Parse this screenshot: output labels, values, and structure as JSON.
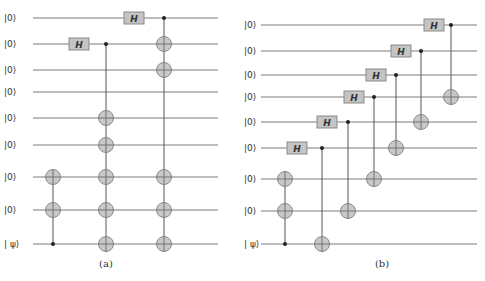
{
  "colors": {
    "wire": "#7a7a7a",
    "gate_fill": "#c4c4c4",
    "target_fill": "#c8c8c8",
    "control": "#222222"
  },
  "gate_label": "H",
  "circuits": [
    {
      "id": "a",
      "caption": "(a)",
      "caption_pos": [
        106,
        267
      ],
      "wire_x": [
        33,
        218
      ],
      "label_x": 4,
      "wires": [
        {
          "label": "|0⟩",
          "y": 18
        },
        {
          "label": "|0⟩",
          "y": 44
        },
        {
          "label": "|0⟩",
          "y": 70
        },
        {
          "label": "|0⟩",
          "y": 92
        },
        {
          "label": "|0⟩",
          "y": 118
        },
        {
          "label": "|0⟩",
          "y": 145
        },
        {
          "label": "|0⟩",
          "y": 177
        },
        {
          "label": "|0⟩",
          "y": 210
        },
        {
          "label": "| ψ⟩",
          "y": 244
        }
      ],
      "hadamards": [
        {
          "wire": 1,
          "x": 79
        },
        {
          "wire": 0,
          "x": 134
        }
      ],
      "gates": [
        {
          "x": 53,
          "control": 8,
          "targets": [
            6,
            7
          ]
        },
        {
          "x": 106,
          "control": 1,
          "targets": [
            4,
            5,
            6,
            7,
            8
          ]
        },
        {
          "x": 164,
          "control": 0,
          "targets": [
            1,
            2,
            6,
            7,
            8
          ]
        }
      ]
    },
    {
      "id": "b",
      "caption": "(b)",
      "caption_pos": [
        382,
        267
      ],
      "wire_x": [
        261,
        477
      ],
      "label_x": 244,
      "wires": [
        {
          "label": "|0⟩",
          "y": 25
        },
        {
          "label": "|0⟩",
          "y": 51
        },
        {
          "label": "|0⟩",
          "y": 75
        },
        {
          "label": "|0⟩",
          "y": 97
        },
        {
          "label": "|0⟩",
          "y": 122
        },
        {
          "label": "|0⟩",
          "y": 148
        },
        {
          "label": "|0⟩",
          "y": 179
        },
        {
          "label": "|0⟩",
          "y": 211
        },
        {
          "label": "| ψ⟩",
          "y": 244
        }
      ],
      "hadamards": [
        {
          "wire": 5,
          "x": 297
        },
        {
          "wire": 4,
          "x": 327
        },
        {
          "wire": 3,
          "x": 354
        },
        {
          "wire": 2,
          "x": 376
        },
        {
          "wire": 1,
          "x": 401
        },
        {
          "wire": 0,
          "x": 434
        }
      ],
      "gates": [
        {
          "x": 285,
          "control": 8,
          "targets": [
            6,
            7
          ]
        },
        {
          "x": 322,
          "control": 5,
          "targets": [
            8
          ]
        },
        {
          "x": 348,
          "control": 4,
          "targets": [
            7
          ]
        },
        {
          "x": 374,
          "control": 3,
          "targets": [
            6
          ]
        },
        {
          "x": 396,
          "control": 2,
          "targets": [
            5
          ]
        },
        {
          "x": 421,
          "control": 1,
          "targets": [
            4
          ]
        },
        {
          "x": 451,
          "control": 0,
          "targets": [
            3
          ]
        }
      ]
    }
  ]
}
